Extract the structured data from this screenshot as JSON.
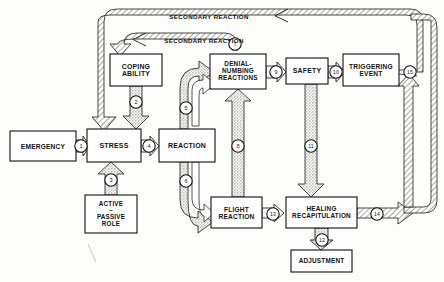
{
  "figure": {
    "kind": "flow-diagram",
    "background": "#fdfdfb",
    "stroke": "#111111",
    "fill_light": "#f2f2f0",
    "fill_hatch": "#d8d8d4"
  },
  "nodes": [
    {
      "id": "emergency",
      "label": "EMERGENCY",
      "x": 10,
      "y": 131,
      "w": 66,
      "h": 30,
      "font": 6.6
    },
    {
      "id": "stress",
      "label": "STRESS",
      "x": 87,
      "y": 129,
      "w": 54,
      "h": 33,
      "font": 7.0
    },
    {
      "id": "reaction",
      "label": "REACTION",
      "x": 159,
      "y": 129,
      "w": 56,
      "h": 33,
      "font": 7.0
    },
    {
      "id": "coping",
      "label": "COPING\nABILITY",
      "x": 110,
      "y": 54,
      "w": 52,
      "h": 32,
      "font": 6.9
    },
    {
      "id": "denial",
      "label": "DENIAL-\nNUMBING\nREACTIONS",
      "x": 210,
      "y": 54,
      "w": 56,
      "h": 35,
      "font": 6.4
    },
    {
      "id": "safety",
      "label": "SAFETY",
      "x": 286,
      "y": 58,
      "w": 42,
      "h": 26,
      "font": 6.9
    },
    {
      "id": "trigger",
      "label": "TRIGGERING\nEVENT",
      "x": 343,
      "y": 54,
      "w": 56,
      "h": 32,
      "font": 6.6
    },
    {
      "id": "activepass",
      "label": "ACTIVE\n–\nPASSIVE\nROLE",
      "x": 85,
      "y": 195,
      "w": 52,
      "h": 38,
      "font": 6.3
    },
    {
      "id": "flight",
      "label": "FLIGHT\nREACTION",
      "x": 211,
      "y": 197,
      "w": 51,
      "h": 31,
      "font": 6.6
    },
    {
      "id": "healing",
      "label": "HEALING\nRECAPITULATION",
      "x": 286,
      "y": 197,
      "w": 71,
      "h": 31,
      "font": 6.4
    },
    {
      "id": "adjustment",
      "label": "ADJUSTMENT",
      "x": 291,
      "y": 250,
      "w": 61,
      "h": 22,
      "font": 6.4
    }
  ],
  "loop_labels": [
    {
      "id": "secondary-reaction-outer",
      "text": "SECONDARY REACTION",
      "x": 149,
      "y": 12,
      "w": 120,
      "h": 10,
      "font": 6.2
    },
    {
      "id": "secondary-reaction-inner",
      "text": "SECONDARY REACTION",
      "x": 144,
      "y": 36,
      "w": 120,
      "h": 10,
      "font": 6.2
    }
  ],
  "numbers": [
    {
      "id": "n1",
      "value": "1",
      "cx": 81,
      "cy": 146,
      "r": 6.2,
      "font": 5.6
    },
    {
      "id": "n2",
      "value": "2",
      "cx": 126,
      "cy": 102,
      "r": 6.2,
      "font": 5.6
    },
    {
      "id": "n3",
      "value": "3",
      "cx": 111,
      "cy": 180,
      "r": 6.2,
      "font": 5.6
    },
    {
      "id": "n4",
      "value": "4",
      "cx": 149,
      "cy": 146,
      "r": 6.2,
      "font": 5.6
    },
    {
      "id": "n5",
      "value": "5",
      "cx": 186,
      "cy": 108,
      "r": 6.2,
      "font": 5.6
    },
    {
      "id": "n6",
      "value": "6",
      "cx": 186,
      "cy": 181,
      "r": 6.2,
      "font": 5.6
    },
    {
      "id": "n7",
      "value": "7",
      "cx": 235,
      "cy": 44,
      "r": 6.2,
      "font": 5.6
    },
    {
      "id": "n8",
      "value": "8",
      "cx": 240,
      "cy": 146,
      "r": 6.2,
      "font": 5.6
    },
    {
      "id": "n9",
      "value": "9",
      "cx": 276,
      "cy": 72,
      "r": 6.2,
      "font": 5.6
    },
    {
      "id": "n10",
      "value": "10",
      "cx": 336,
      "cy": 72,
      "r": 6.2,
      "font": 5.2
    },
    {
      "id": "n11",
      "value": "11",
      "cx": 311,
      "cy": 146,
      "r": 6.2,
      "font": 5.2
    },
    {
      "id": "n12",
      "value": "12",
      "cx": 322,
      "cy": 240,
      "r": 6.2,
      "font": 5.2
    },
    {
      "id": "n13",
      "value": "13",
      "cx": 273,
      "cy": 214,
      "r": 6.2,
      "font": 5.2
    },
    {
      "id": "n14",
      "value": "14",
      "cx": 377,
      "cy": 214,
      "r": 6.2,
      "font": 5.2
    },
    {
      "id": "n15",
      "value": "15",
      "cx": 410,
      "cy": 72,
      "r": 6.2,
      "font": 5.2
    }
  ],
  "flows": [
    {
      "id": "f1",
      "from": "emergency",
      "to": "stress",
      "arrow": "open-right"
    },
    {
      "id": "f2",
      "from": "coping",
      "to": "stress",
      "arrow": "solid-down"
    },
    {
      "id": "f3",
      "from": "activepass",
      "to": "stress",
      "arrow": "solid-up"
    },
    {
      "id": "f4",
      "from": "stress",
      "to": "reaction",
      "arrow": "open-right"
    },
    {
      "id": "f5",
      "from": "reaction",
      "to": "denial",
      "arrow": "open-curve-up"
    },
    {
      "id": "f6",
      "from": "reaction",
      "to": "flight",
      "arrow": "open-curve-down"
    },
    {
      "id": "f7",
      "from": "denial",
      "to": "coping",
      "arrow": "secondary-reaction-inner"
    },
    {
      "id": "f8",
      "from": "flight",
      "to": "denial",
      "arrow": "solid-up"
    },
    {
      "id": "f9",
      "from": "denial",
      "to": "safety",
      "arrow": "open-right"
    },
    {
      "id": "f10",
      "from": "safety",
      "to": "trigger",
      "arrow": "open-right"
    },
    {
      "id": "f11",
      "from": "safety",
      "to": "healing",
      "arrow": "solid-down"
    },
    {
      "id": "f12",
      "from": "healing",
      "to": "adjustment",
      "arrow": "open-down"
    },
    {
      "id": "f13",
      "from": "flight",
      "to": "healing",
      "arrow": "open-right"
    },
    {
      "id": "f14",
      "from": "healing",
      "to": "trigger",
      "arrow": "hatched-loop-right"
    },
    {
      "id": "f15",
      "from": "trigger",
      "to": "stress",
      "arrow": "secondary-reaction-outer"
    }
  ]
}
